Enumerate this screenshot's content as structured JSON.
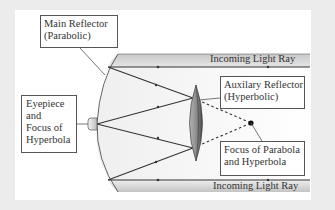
{
  "diagram": {
    "labels": {
      "main_reflector": [
        "Main Reflector",
        "(Parabolic)"
      ],
      "auxiliary_reflector": [
        "Auxilary Reflector",
        "(Hyperbolic)"
      ],
      "eyepiece": [
        "Eyepiece",
        "and",
        "Focus of",
        "Hyperbola"
      ],
      "focus": [
        "Focus of Parabola",
        "and Hyperbola"
      ],
      "incoming_top": "Incoming Light Ray",
      "incoming_bottom": "Incoming Light Ray"
    },
    "colors": {
      "background": "#ececec",
      "panel": "#ffffff",
      "tube_band": "#d6d6d6",
      "lens_dark": "#555555",
      "lens_light": "#a8a8a8",
      "line": "#333333"
    }
  }
}
